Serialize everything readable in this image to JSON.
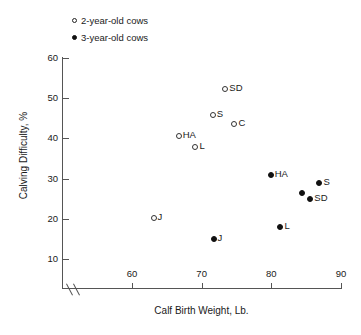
{
  "chart_data": {
    "type": "scatter",
    "title": "",
    "xlabel": "Calf Birth Weight, Lb.",
    "ylabel": "Calving Difficulty, %",
    "xlim": [
      55,
      90
    ],
    "ylim": [
      5,
      62
    ],
    "x_ticks": [
      60,
      70,
      80,
      90
    ],
    "y_ticks": [
      10,
      20,
      30,
      40,
      50,
      60
    ],
    "grid": false,
    "x_axis_break": true,
    "legend_position": "top-left",
    "series": [
      {
        "name": "2-year-old cows",
        "marker": "open-circle",
        "points": [
          {
            "label": "SD",
            "x": 73.4,
            "y": 52.3
          },
          {
            "label": "S",
            "x": 71.6,
            "y": 45.7
          },
          {
            "label": "C",
            "x": 74.7,
            "y": 43.5
          },
          {
            "label": "HA",
            "x": 66.7,
            "y": 40.5
          },
          {
            "label": "L",
            "x": 69.1,
            "y": 37.9
          },
          {
            "label": "J",
            "x": 63.1,
            "y": 20.3
          }
        ]
      },
      {
        "name": "3-year-old cows",
        "marker": "filled-circle",
        "points": [
          {
            "label": "HA",
            "x": 79.9,
            "y": 31.0
          },
          {
            "label": "S",
            "x": 86.9,
            "y": 29.0
          },
          {
            "label": "",
            "x": 84.4,
            "y": 26.3
          },
          {
            "label": "SD",
            "x": 85.6,
            "y": 24.9
          },
          {
            "label": "L",
            "x": 81.3,
            "y": 18.0
          },
          {
            "label": "J",
            "x": 71.7,
            "y": 15.0
          }
        ]
      }
    ]
  },
  "legend": {
    "items": [
      {
        "label": "2-year-old cows",
        "marker": "open-circle"
      },
      {
        "label": "3-year-old cows",
        "marker": "filled-circle"
      }
    ]
  },
  "colors": {
    "axis": "#555555",
    "marker_open_stroke": "#333333",
    "marker_filled": "#111111",
    "text": "#1a1a1a",
    "background": "#ffffff"
  }
}
